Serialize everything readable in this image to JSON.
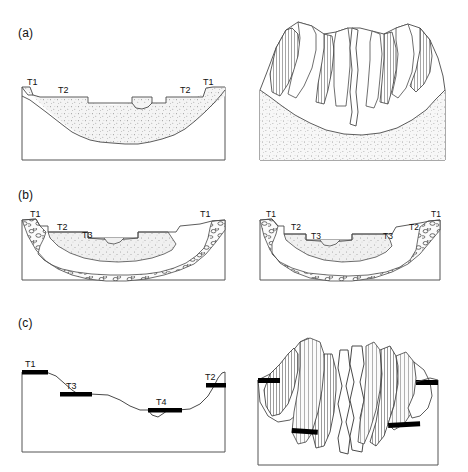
{
  "figure": {
    "background_color": "#ffffff",
    "line_color": "#333333",
    "fill_alluvium": "#f2f2f2",
    "fill_terrace_bar": "#000000"
  },
  "panels": [
    {
      "letter": "(a)",
      "stage": "a",
      "cross_section": {
        "name": "valley-cross-section-a",
        "labels": [
          {
            "text": "T1",
            "x": 29,
            "y": 82,
            "side": "left"
          },
          {
            "text": "T2",
            "x": 60,
            "y": 89,
            "side": "left"
          },
          {
            "text": "T2",
            "x": 182,
            "y": 89,
            "side": "right"
          },
          {
            "text": "T1",
            "x": 206,
            "y": 82,
            "side": "right"
          }
        ],
        "units": [
          "stippled alluvial fill",
          "valley floor incision notch"
        ]
      },
      "block_diagram": {
        "name": "block-diagram-a",
        "features": [
          "paired terrace treads",
          "hachured terrace scarps",
          "stippled valley fill",
          "incised modern channel"
        ]
      }
    },
    {
      "letter": "(b)",
      "stage": "b",
      "cross_section": {
        "name": "valley-cross-section-b",
        "labels": [
          {
            "text": "T1",
            "x": 34,
            "y": 213,
            "side": "left"
          },
          {
            "text": "T2",
            "x": 62,
            "y": 226,
            "side": "left"
          },
          {
            "text": "T3",
            "x": 86,
            "y": 236,
            "side": "left"
          },
          {
            "text": "T1",
            "x": 203,
            "y": 213,
            "side": "right"
          }
        ],
        "units": [
          "coarse gravel / cobble bed",
          "stippled fine fill",
          "bedrock strath"
        ]
      },
      "block_diagram": {
        "name": "block-diagram-b",
        "labels": [
          {
            "text": "T1",
            "x": 268,
            "y": 213,
            "side": "left"
          },
          {
            "text": "T2",
            "x": 293,
            "y": 226,
            "side": "left"
          },
          {
            "text": "T3",
            "x": 313,
            "y": 236,
            "side": "left"
          },
          {
            "text": "T3",
            "x": 385,
            "y": 236,
            "side": "right"
          },
          {
            "text": "T2",
            "x": 411,
            "y": 226,
            "side": "right"
          },
          {
            "text": "T1",
            "x": 433,
            "y": 213,
            "side": "right"
          }
        ],
        "features": [
          "coarse gravel / cobble bed",
          "stippled fine fill",
          "nested terrace treads"
        ]
      }
    },
    {
      "letter": "(c)",
      "stage": "c",
      "cross_section": {
        "name": "valley-cross-section-c",
        "labels": [
          {
            "text": "T1",
            "x": 27,
            "y": 368,
            "side": "left"
          },
          {
            "text": "T3",
            "x": 70,
            "y": 389,
            "side": "left"
          },
          {
            "text": "T4",
            "x": 160,
            "y": 405,
            "side": "right"
          },
          {
            "text": "T2",
            "x": 209,
            "y": 378,
            "side": "right"
          }
        ],
        "units": [
          "black terrace remnant bars",
          "bedrock valley profile"
        ]
      },
      "block_diagram": {
        "name": "block-diagram-c",
        "features": [
          "unpaired terrace remnants",
          "heavily hachured scarps",
          "sinuous incised channel",
          "black terrace caps"
        ]
      }
    }
  ]
}
